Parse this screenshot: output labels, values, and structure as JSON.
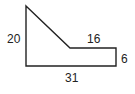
{
  "diagram": {
    "type": "composite-shape",
    "stroke_color": "#222222",
    "labels": {
      "left_height": "20",
      "top_right_length": "16",
      "right_height": "6",
      "bottom_length": "31"
    }
  }
}
